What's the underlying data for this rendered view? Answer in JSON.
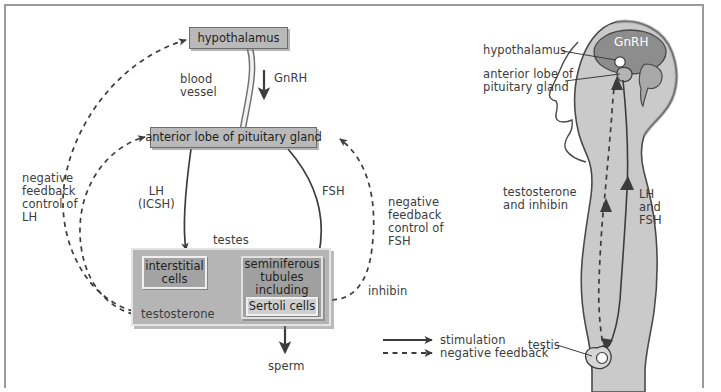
{
  "diagram": {
    "left_panel": {
      "boxes": {
        "hypothalamus": "hypothalamus",
        "anterior_pituitary": "anterior lobe of pituitary gland",
        "interstitial_cells": "interstitial\ncells",
        "seminiferous_tubules": "seminiferous\ntubules\nincluding",
        "sertoli_cells": "Sertoli cells"
      },
      "labels": {
        "blood_vessel": "blood\nvessel",
        "gnrh": "GnRH",
        "lh_icsh": "LH\n(ICSH)",
        "fsh": "FSH",
        "negative_feedback_lh": "negative\nfeedback\ncontrol of\nLH",
        "negative_feedback_fsh": "negative\nfeedback\ncontrol of\nFSH",
        "testes": "testes",
        "testosterone": "testosterone",
        "inhibin": "inhibin",
        "sperm": "sperm"
      }
    },
    "legend": {
      "stimulation": "stimulation",
      "negative_feedback": "negative feedback"
    },
    "right_panel": {
      "labels": {
        "hypothalamus": "hypothalamus",
        "anterior_lobe": "anterior lobe of\npituitary gland",
        "gnrh": "GnRH",
        "lh_and_fsh": "LH\nand\nFSH",
        "testosterone_inhibin": "testosterone\nand inhibin",
        "testis": "testis"
      }
    },
    "colors": {
      "box_fill": "#b9b9b9",
      "box_dark_fill": "#a3a3a3",
      "box_light_fill": "#cfcfcf",
      "testes_fill": "#b5b5b5",
      "tubules_fill": "#a0a0a0",
      "body_fill": "#c9c9c9",
      "brain_fill": "#8f8f8f",
      "stroke": "#3c3c3c",
      "frame": "#9a9a9a"
    }
  }
}
